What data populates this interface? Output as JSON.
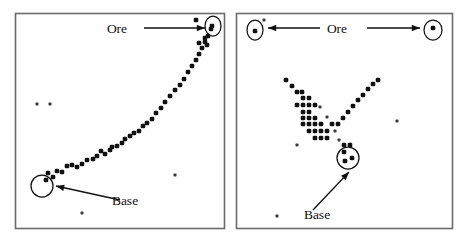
{
  "figure": {
    "type": "two-panel-simulation-snapshot",
    "background_color": "#ffffff",
    "ink_color": "#111111",
    "border_color": "#6b6b6b",
    "panels": [
      {
        "id": "left",
        "name": "left-panel",
        "frame": {
          "x": 15,
          "y": 13,
          "w": 209,
          "h": 215
        },
        "labels": [
          {
            "name": "ore-label",
            "text": "Ore",
            "x": 117,
            "y": 33
          },
          {
            "name": "base-label",
            "text": "Base",
            "x": 125,
            "y": 205
          }
        ],
        "arrows": [
          {
            "name": "ore-arrow",
            "x1": 144,
            "y1": 28,
            "x2": 205,
            "y2": 28
          },
          {
            "name": "base-arrow",
            "x1": 120,
            "y1": 200,
            "x2": 56,
            "y2": 186
          }
        ],
        "circles": [
          {
            "name": "ore-site-circle",
            "cx": 213,
            "cy": 26,
            "rx": 8,
            "ry": 10
          },
          {
            "name": "base-site-circle",
            "cx": 42,
            "cy": 186,
            "rx": 11,
            "ry": 11
          }
        ],
        "agent_dots": [
          [
            46,
            180
          ],
          [
            48,
            173
          ],
          [
            53,
            177
          ],
          [
            57,
            171
          ],
          [
            62,
            172
          ],
          [
            67,
            166
          ],
          [
            72,
            165
          ],
          [
            77,
            167
          ],
          [
            82,
            164
          ],
          [
            87,
            160
          ],
          [
            93,
            159
          ],
          [
            97,
            156
          ],
          [
            101,
            151
          ],
          [
            105,
            154
          ],
          [
            110,
            150
          ],
          [
            112,
            147
          ],
          [
            117,
            146
          ],
          [
            122,
            143
          ],
          [
            125,
            139
          ],
          [
            130,
            136
          ],
          [
            134,
            133
          ],
          [
            139,
            131
          ],
          [
            143,
            126
          ],
          [
            147,
            123
          ],
          [
            152,
            119
          ],
          [
            156,
            113
          ],
          [
            161,
            108
          ],
          [
            165,
            102
          ],
          [
            170,
            96
          ],
          [
            175,
            90
          ],
          [
            180,
            85
          ],
          [
            184,
            79
          ],
          [
            188,
            72
          ],
          [
            192,
            66
          ],
          [
            196,
            60
          ],
          [
            199,
            54
          ],
          [
            202,
            48
          ],
          [
            205,
            42
          ],
          [
            208,
            36
          ],
          [
            211,
            29
          ],
          [
            196,
            20
          ],
          [
            205,
            38
          ],
          [
            199,
            43
          ],
          [
            207,
            45
          ],
          [
            212,
            26
          ]
        ],
        "stray_dots": [
          [
            37,
            104
          ],
          [
            50,
            104
          ],
          [
            175,
            175
          ],
          [
            82,
            213
          ]
        ]
      },
      {
        "id": "right",
        "name": "right-panel",
        "frame": {
          "x": 236,
          "y": 13,
          "w": 216,
          "h": 215
        },
        "labels": [
          {
            "name": "ore-label",
            "text": "Ore",
            "x": 337,
            "y": 33
          },
          {
            "name": "base-label",
            "text": "Base",
            "x": 317,
            "y": 219
          }
        ],
        "arrows": [
          {
            "name": "ore-arrow-left",
            "x1": 320,
            "y1": 28,
            "x2": 268,
            "y2": 28
          },
          {
            "name": "ore-arrow-right",
            "x1": 367,
            "y1": 28,
            "x2": 420,
            "y2": 28
          },
          {
            "name": "base-arrow",
            "x1": 313,
            "y1": 210,
            "x2": 349,
            "y2": 172
          }
        ],
        "circles": [
          {
            "name": "ore-site-circle-left",
            "cx": 255,
            "cy": 30,
            "rx": 8,
            "ry": 10
          },
          {
            "name": "ore-site-circle-right",
            "cx": 433,
            "cy": 30,
            "rx": 9,
            "ry": 10
          },
          {
            "name": "base-site-circle",
            "cx": 348,
            "cy": 158,
            "rx": 11,
            "ry": 11
          }
        ],
        "agent_dots": [
          [
            286,
            80
          ],
          [
            292,
            86
          ],
          [
            297,
            92
          ],
          [
            302,
            92
          ],
          [
            303,
            98
          ],
          [
            309,
            98
          ],
          [
            297,
            105
          ],
          [
            303,
            105
          ],
          [
            309,
            105
          ],
          [
            315,
            105
          ],
          [
            303,
            112
          ],
          [
            309,
            112
          ],
          [
            303,
            118
          ],
          [
            309,
            118
          ],
          [
            315,
            118
          ],
          [
            303,
            124
          ],
          [
            309,
            124
          ],
          [
            315,
            124
          ],
          [
            321,
            124
          ],
          [
            309,
            131
          ],
          [
            315,
            131
          ],
          [
            321,
            131
          ],
          [
            327,
            131
          ],
          [
            332,
            124
          ],
          [
            338,
            124
          ],
          [
            343,
            118
          ],
          [
            348,
            112
          ],
          [
            353,
            106
          ],
          [
            358,
            100
          ],
          [
            363,
            95
          ],
          [
            368,
            89
          ],
          [
            373,
            84
          ],
          [
            378,
            80
          ],
          [
            315,
            138
          ],
          [
            321,
            138
          ],
          [
            327,
            138
          ],
          [
            344,
            145
          ],
          [
            350,
            145
          ],
          [
            344,
            152
          ],
          [
            352,
            158
          ],
          [
            345,
            161
          ],
          [
            255,
            31
          ],
          [
            433,
            28
          ]
        ],
        "stray_dots": [
          [
            264,
            20
          ],
          [
            397,
            121
          ],
          [
            297,
            145
          ],
          [
            277,
            216
          ],
          [
            320,
            107
          ],
          [
            327,
            117
          ],
          [
            335,
            131
          ],
          [
            339,
            140
          ]
        ]
      }
    ]
  }
}
